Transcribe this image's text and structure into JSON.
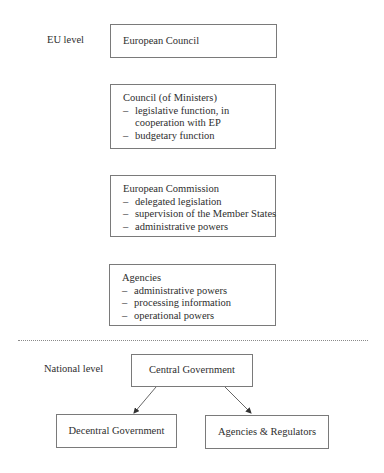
{
  "eu_section": {
    "label": "EU level",
    "boxes": [
      {
        "title": "European Council",
        "items": []
      },
      {
        "title": "Council (of Ministers)",
        "items": [
          {
            "text": "legislative function, in"
          },
          {
            "text": "cooperation with EP",
            "continuation": true
          },
          {
            "text": "budgetary function"
          }
        ]
      },
      {
        "title": "European Commission",
        "items": [
          {
            "text": "delegated legislation"
          },
          {
            "text": "supervision of the Member States"
          },
          {
            "text": "administrative powers"
          }
        ]
      },
      {
        "title": "Agencies",
        "items": [
          {
            "text": "administrative powers"
          },
          {
            "text": "processing information"
          },
          {
            "text": "operational powers"
          }
        ]
      }
    ]
  },
  "national_section": {
    "label": "National level",
    "root": "Central Government",
    "children": [
      "Decentral Government",
      "Agencies & Regulators"
    ]
  },
  "bullet_symbol": "–",
  "colors": {
    "box_border": "#7a7a7a",
    "text": "#2e2e2e",
    "divider": "#8a8a8a",
    "arrow": "#333333"
  }
}
